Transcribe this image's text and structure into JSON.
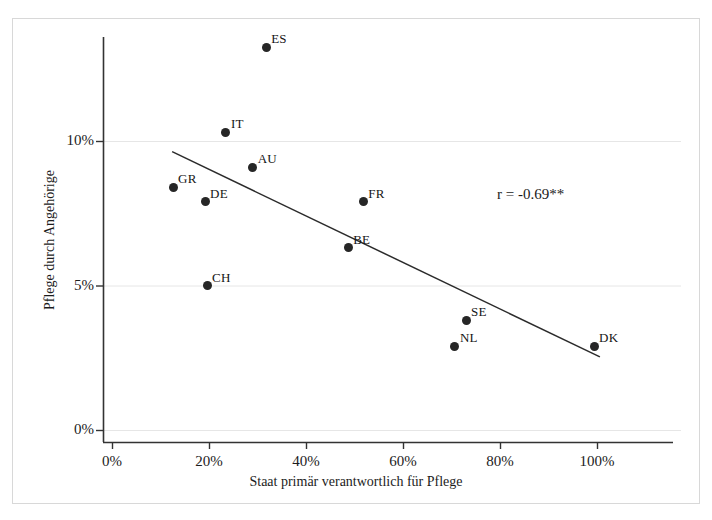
{
  "chart_data": {
    "type": "scatter",
    "title": "",
    "xlabel": "Staat primär verantwortlich für Pflege",
    "ylabel": "Pflege durch Angehörige",
    "xlim": [
      0,
      100
    ],
    "ylim": [
      0,
      14
    ],
    "xticks": [
      "0%",
      "20%",
      "40%",
      "60%",
      "80%",
      "100%"
    ],
    "xtick_values": [
      0,
      20,
      40,
      60,
      80,
      100
    ],
    "yticks": [
      "0%",
      "5%",
      "10%"
    ],
    "ytick_values": [
      0,
      5,
      10
    ],
    "grid": "horizontal",
    "legend": "none",
    "annotation": "r = -0.69**",
    "points": [
      {
        "label": "ES",
        "x": 31.8,
        "y": 13.25,
        "label_dx": 8,
        "label_dy": -14
      },
      {
        "label": "IT",
        "x": 23.5,
        "y": 10.3,
        "label_dx": 8,
        "label_dy": -14
      },
      {
        "label": "AU",
        "x": 29.0,
        "y": 9.1,
        "label_dx": 8,
        "label_dy": -14
      },
      {
        "label": "GR",
        "x": 12.6,
        "y": 8.4,
        "label_dx": 8,
        "label_dy": -14
      },
      {
        "label": "DE",
        "x": 19.2,
        "y": 7.9,
        "label_dx": 8,
        "label_dy": -14
      },
      {
        "label": "FR",
        "x": 51.8,
        "y": 7.9,
        "label_dx": 8,
        "label_dy": -14
      },
      {
        "label": "BE",
        "x": 48.7,
        "y": 6.3,
        "label_dx": 8,
        "label_dy": -14
      },
      {
        "label": "CH",
        "x": 19.6,
        "y": 5.0,
        "label_dx": 8,
        "label_dy": -14
      },
      {
        "label": "SE",
        "x": 73.0,
        "y": 3.8,
        "label_dx": 8,
        "label_dy": -14
      },
      {
        "label": "NL",
        "x": 70.7,
        "y": 2.9,
        "label_dx": 8,
        "label_dy": -14
      },
      {
        "label": "DK",
        "x": 99.4,
        "y": 2.9,
        "label_dx": 8,
        "label_dy": -14
      }
    ],
    "trendline": {
      "x0": 12.4,
      "y0": 9.63,
      "x1": 100.6,
      "y1": 2.53
    },
    "colors": {
      "marker": "#262626",
      "trendline": "#2b2b2b",
      "axis": "#333333",
      "gridline": "#e6e6e6",
      "frame": "#d8d8d8",
      "text": "#1a1a1a",
      "background": "#ffffff"
    }
  }
}
